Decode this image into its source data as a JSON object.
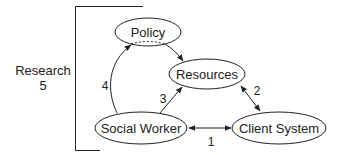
{
  "diagram": {
    "type": "relationship-diagram",
    "nodes": [
      {
        "id": "policy",
        "label": "Policy"
      },
      {
        "id": "resources",
        "label": "Resources"
      },
      {
        "id": "social_worker",
        "label": "Social Worker"
      },
      {
        "id": "client_system",
        "label": "Client System"
      }
    ],
    "edges": [
      {
        "from": "social_worker",
        "to": "client_system",
        "label": "1",
        "direction": "bidirectional"
      },
      {
        "from": "resources",
        "to": "client_system",
        "label": "2",
        "direction": "bidirectional"
      },
      {
        "from": "social_worker",
        "to": "resources",
        "label": "3",
        "direction": "forward"
      },
      {
        "from": "social_worker",
        "to": "policy",
        "label": "4",
        "direction": "forward"
      },
      {
        "from": "policy",
        "to": "resources",
        "label": "",
        "direction": "forward"
      }
    ],
    "bracket": {
      "label_line1": "Research",
      "label_line2": "5"
    },
    "colors": {
      "stroke": "#222222",
      "background": "#ffffff"
    }
  }
}
